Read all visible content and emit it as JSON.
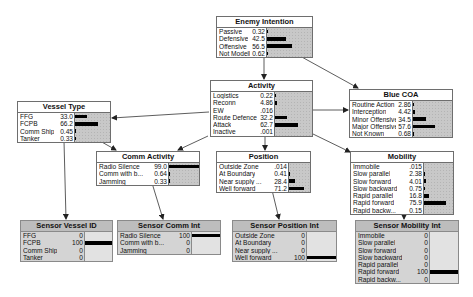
{
  "diagram": {
    "type": "bayesian-network",
    "nodes": [
      {
        "id": "enemy_intention",
        "title": "Enemy Intention",
        "x": 216,
        "y": 16,
        "w": 97,
        "lw": 46,
        "sensor": false,
        "states": [
          {
            "label": "Passive",
            "value": "0.32",
            "p": 0.32
          },
          {
            "label": "Defensive",
            "value": "42.5",
            "p": 42.5
          },
          {
            "label": "Offensive",
            "value": "56.5",
            "p": 56.5
          },
          {
            "label": "Not Modelled",
            "value": "0.62",
            "p": 0.62
          }
        ]
      },
      {
        "id": "activity",
        "title": "Activity",
        "x": 210,
        "y": 80,
        "w": 103,
        "lw": 60,
        "sensor": false,
        "states": [
          {
            "label": "Logistics",
            "value": "0.22",
            "p": 0.22
          },
          {
            "label": "Reconn",
            "value": "4.86",
            "p": 4.86
          },
          {
            "label": "EW",
            "value": ".016",
            "p": 0.016
          },
          {
            "label": "Route Defence",
            "value": "32.2",
            "p": 32.2
          },
          {
            "label": "Attack",
            "value": "62.7",
            "p": 62.7
          },
          {
            "label": "Inactive",
            "value": ".001",
            "p": 0.001
          }
        ]
      },
      {
        "id": "blue_coa",
        "title": "Blue COA",
        "x": 349,
        "y": 89,
        "w": 104,
        "lw": 59,
        "sensor": false,
        "states": [
          {
            "label": "Routine Action",
            "value": "2.86",
            "p": 2.86
          },
          {
            "label": "Interception",
            "value": "4.42",
            "p": 4.42
          },
          {
            "label": "Minor Offensive",
            "value": "34.5",
            "p": 34.5
          },
          {
            "label": "Major Offensive",
            "value": "57.6",
            "p": 57.6
          },
          {
            "label": "Not Known",
            "value": "0.68",
            "p": 0.68
          }
        ]
      },
      {
        "id": "vessel_type",
        "title": "Vessel Type",
        "x": 17,
        "y": 101,
        "w": 94,
        "lw": 53,
        "sensor": false,
        "states": [
          {
            "label": "FFG",
            "value": "33.0",
            "p": 33.0
          },
          {
            "label": "FCPB",
            "value": "66.2",
            "p": 66.2
          },
          {
            "label": "Comm Ship",
            "value": "0.45",
            "p": 0.45
          },
          {
            "label": "Tanker",
            "value": "0.33",
            "p": 0.33
          }
        ]
      },
      {
        "id": "comm_activity",
        "title": "Comm Activity",
        "x": 96,
        "y": 151,
        "w": 104,
        "lw": 68,
        "sensor": false,
        "states": [
          {
            "label": "Radio Silence",
            "value": "99.0",
            "p": 99.0
          },
          {
            "label": "Comm with b...",
            "value": "0.64",
            "p": 0.64
          },
          {
            "label": "Jamming",
            "value": "0.33",
            "p": 0.33
          }
        ]
      },
      {
        "id": "position",
        "title": "Position",
        "x": 216,
        "y": 151,
        "w": 95,
        "lw": 68,
        "sensor": false,
        "states": [
          {
            "label": "Outside Zone",
            "value": ".014",
            "p": 0.014
          },
          {
            "label": "At Boundary",
            "value": "0.41",
            "p": 0.41
          },
          {
            "label": "Near supply ...",
            "value": "28.4",
            "p": 28.4
          },
          {
            "label": "Well forward",
            "value": "71.2",
            "p": 71.2
          }
        ]
      },
      {
        "id": "mobility",
        "title": "Mobility",
        "x": 350,
        "y": 151,
        "w": 104,
        "lw": 69,
        "sensor": false,
        "states": [
          {
            "label": "Immobile",
            "value": ".015",
            "p": 0.015
          },
          {
            "label": "Slow parallel",
            "value": "2.38",
            "p": 2.38
          },
          {
            "label": "Slow forward",
            "value": "4.01",
            "p": 4.01
          },
          {
            "label": "Slow backward",
            "value": "0.75",
            "p": 0.75
          },
          {
            "label": "Rapid parallel",
            "value": "16.8",
            "p": 16.8
          },
          {
            "label": "Rapid forward",
            "value": "75.9",
            "p": 75.9
          },
          {
            "label": "Rapid backw...",
            "value": "0.15",
            "p": 0.15
          }
        ]
      },
      {
        "id": "sensor_vessel_id",
        "title": "Sensor Vessel ID",
        "x": 20,
        "y": 220,
        "w": 93,
        "lw": 60,
        "sensor": true,
        "states": [
          {
            "label": "FFG",
            "value": "0",
            "p": 0
          },
          {
            "label": "FCPB",
            "value": "100",
            "p": 100
          },
          {
            "label": "Comm Ship",
            "value": "0",
            "p": 0
          },
          {
            "label": "Tanker",
            "value": "0",
            "p": 0
          }
        ]
      },
      {
        "id": "sensor_comm_int",
        "title": "Sensor Comm Int",
        "x": 117,
        "y": 220,
        "w": 104,
        "lw": 70,
        "sensor": true,
        "states": [
          {
            "label": "Radio Silence",
            "value": "100",
            "p": 100
          },
          {
            "label": "Comm with b...",
            "value": "0",
            "p": 0
          },
          {
            "label": "Jamming",
            "value": "0",
            "p": 0
          }
        ]
      },
      {
        "id": "sensor_position_int",
        "title": "Sensor Position Int",
        "x": 232,
        "y": 220,
        "w": 105,
        "lw": 70,
        "sensor": true,
        "states": [
          {
            "label": "Outside Zone",
            "value": "0",
            "p": 0
          },
          {
            "label": "At Boundary",
            "value": "0",
            "p": 0
          },
          {
            "label": "Near supply ...",
            "value": "0",
            "p": 0
          },
          {
            "label": "Well forward",
            "value": "100",
            "p": 100
          }
        ]
      },
      {
        "id": "sensor_mobility_int",
        "title": "Sensor Mobility Int",
        "x": 355,
        "y": 220,
        "w": 104,
        "lw": 70,
        "sensor": true,
        "states": [
          {
            "label": "Immobile",
            "value": "0",
            "p": 0
          },
          {
            "label": "Slow parallel",
            "value": "0",
            "p": 0
          },
          {
            "label": "Slow forward",
            "value": "0",
            "p": 0
          },
          {
            "label": "Slow backward",
            "value": "0",
            "p": 0
          },
          {
            "label": "Rapid parallel",
            "value": "0",
            "p": 0
          },
          {
            "label": "Rapid forward",
            "value": "100",
            "p": 100
          },
          {
            "label": "Rapid backw...",
            "value": "0",
            "p": 0
          }
        ]
      }
    ],
    "edges": [
      {
        "from": "enemy_intention",
        "to": "activity",
        "x1": 264,
        "y1": 56,
        "x2": 264,
        "y2": 79
      },
      {
        "from": "enemy_intention",
        "to": "blue_coa",
        "x1": 300,
        "y1": 56,
        "x2": 358,
        "y2": 88
      },
      {
        "from": "activity",
        "to": "blue_coa",
        "x1": 313,
        "y1": 110,
        "x2": 348,
        "y2": 110
      },
      {
        "from": "activity",
        "to": "vessel_type",
        "x1": 209,
        "y1": 112,
        "x2": 112,
        "y2": 118
      },
      {
        "from": "activity",
        "to": "comm_activity",
        "x1": 208,
        "y1": 136,
        "x2": 178,
        "y2": 150
      },
      {
        "from": "activity",
        "to": "position",
        "x1": 265,
        "y1": 136,
        "x2": 265,
        "y2": 150
      },
      {
        "from": "activity",
        "to": "mobility",
        "x1": 313,
        "y1": 134,
        "x2": 350,
        "y2": 152
      },
      {
        "from": "vessel_type",
        "to": "comm_activity",
        "x1": 100,
        "y1": 141,
        "x2": 116,
        "y2": 150
      },
      {
        "from": "vessel_type",
        "to": "sensor_vessel_id",
        "x1": 64,
        "y1": 141,
        "x2": 66,
        "y2": 219
      },
      {
        "from": "comm_activity",
        "to": "sensor_comm_int",
        "x1": 152,
        "y1": 183,
        "x2": 163,
        "y2": 219
      },
      {
        "from": "position",
        "to": "sensor_position_int",
        "x1": 272,
        "y1": 190,
        "x2": 279,
        "y2": 219
      },
      {
        "from": "mobility",
        "to": "sensor_mobility_int",
        "x1": 404,
        "y1": 213,
        "x2": 404,
        "y2": 219
      }
    ]
  }
}
